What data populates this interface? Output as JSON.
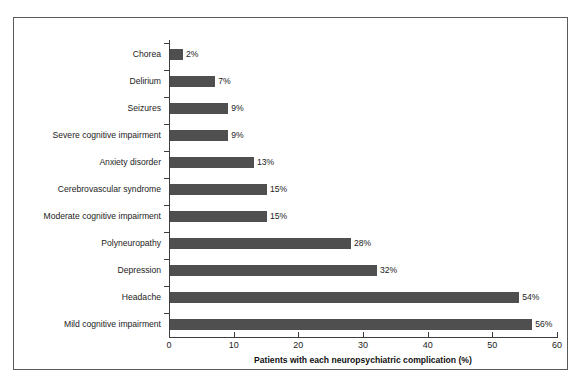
{
  "chart_data": {
    "type": "bar",
    "orientation": "horizontal",
    "title": "",
    "xlabel": "Patients with each neuropsychiatric complication (%)",
    "ylabel": "",
    "xlim": [
      0,
      60
    ],
    "xticks": [
      0,
      10,
      20,
      30,
      40,
      50,
      60
    ],
    "grid": false,
    "legend": null,
    "bar_color": "#4f4f4f",
    "categories": [
      "Chorea",
      "Delirium",
      "Seizures",
      "Severe cognitive impairment",
      "Anxiety disorder",
      "Cerebrovascular syndrome",
      "Moderate cognitive impairment",
      "Polyneuropathy",
      "Depression",
      "Headache",
      "Mild cognitive impairment"
    ],
    "values": [
      2,
      7,
      9,
      9,
      13,
      15,
      15,
      28,
      32,
      54,
      56
    ],
    "data_labels": [
      "2%",
      "7%",
      "9%",
      "9%",
      "13%",
      "15%",
      "15%",
      "28%",
      "32%",
      "54%",
      "56%"
    ]
  }
}
